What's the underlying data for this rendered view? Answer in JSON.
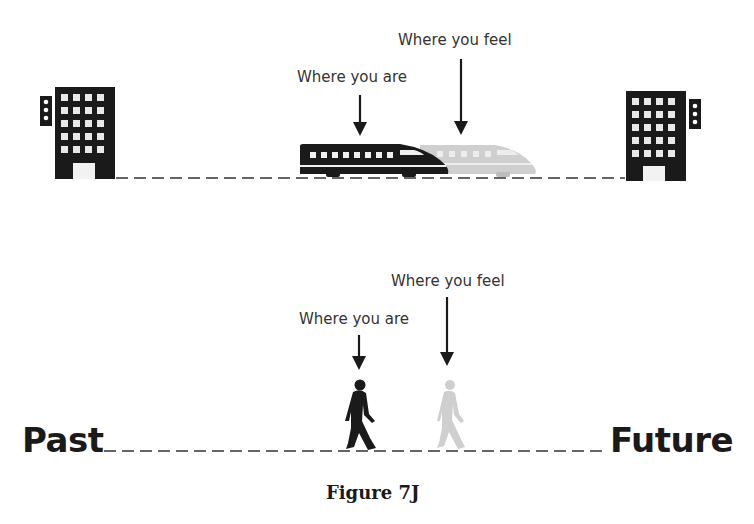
{
  "figure": {
    "caption": "Figure 7J",
    "colors": {
      "ink": "#1a1a1a",
      "ghost": "#cfcfcf",
      "dash": "#333333"
    }
  },
  "top_panel": {
    "label_actual": "Where you are",
    "label_perceived": "Where you feel",
    "left_icon": "office-building-icon",
    "right_icon": "office-building-icon",
    "subject_actual": "bullet-train-icon",
    "subject_perceived": "bullet-train-ghost-icon"
  },
  "bottom_panel": {
    "label_actual": "Where you are",
    "label_perceived": "Where you feel",
    "left_end": "Past",
    "right_end": "Future",
    "subject_actual": "walking-person-icon",
    "subject_perceived": "walking-person-ghost-icon"
  }
}
